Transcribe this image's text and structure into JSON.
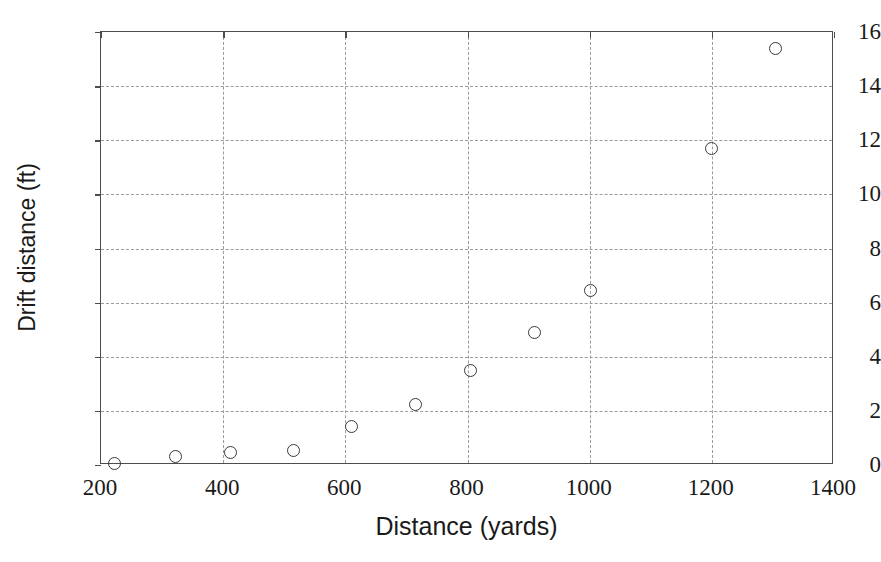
{
  "chart_data": {
    "type": "scatter",
    "title": "",
    "xlabel": "Distance (yards)",
    "ylabel": "Drift distance (ft)",
    "xlim": [
      200,
      1400
    ],
    "ylim": [
      0,
      16
    ],
    "xticks": [
      200,
      400,
      600,
      800,
      1000,
      1200,
      1400
    ],
    "xtick_labels": [
      "200",
      "400",
      "600",
      "800",
      "1000",
      "1200",
      "1400"
    ],
    "yticks": [
      0,
      2,
      4,
      6,
      8,
      10,
      12,
      14,
      16
    ],
    "ytick_labels": [
      "0",
      "2",
      "4",
      "6",
      "8",
      "10",
      "12",
      "14",
      "16"
    ],
    "grid": true,
    "grid_style": "dashed",
    "grid_color": "#9a9a9a",
    "legend": null,
    "marker": "open-circle",
    "marker_color": "#3a3a3a",
    "series": [
      {
        "name": "Drift distance",
        "x": [
          222,
          322,
          412,
          515,
          610,
          715,
          805,
          910,
          1002,
          1200,
          1305
        ],
        "y": [
          0.05,
          0.3,
          0.45,
          0.55,
          1.42,
          2.25,
          3.48,
          4.88,
          6.45,
          11.7,
          15.4
        ]
      }
    ]
  }
}
